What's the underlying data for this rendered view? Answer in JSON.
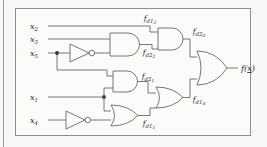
{
  "figure": {
    "kind": "logic-circuit-diagram",
    "colors": {
      "page_background": "#f7f7f5",
      "panel_background": "#fbfbf9",
      "frame_border": "#8d8d8d",
      "wire": "#555555",
      "label_text": "#2b2b2b",
      "junction_dot": "#333333"
    }
  },
  "inputs": [
    {
      "id": "x2",
      "base": "x",
      "sub": "2"
    },
    {
      "id": "x3",
      "base": "x",
      "sub": "3"
    },
    {
      "id": "x5",
      "base": "x",
      "sub": "5"
    },
    {
      "id": "x1",
      "base": "x",
      "sub": "1"
    },
    {
      "id": "x4",
      "base": "x",
      "sub": "4"
    }
  ],
  "signals": [
    {
      "id": "fd12",
      "base": "f",
      "sub": "d1",
      "subsub": "2"
    },
    {
      "id": "fd22",
      "base": "f",
      "sub": "d2",
      "subsub": "2"
    },
    {
      "id": "fd20",
      "base": "f",
      "sub": "d2",
      "subsub": "0"
    },
    {
      "id": "fd21",
      "base": "f",
      "sub": "d2",
      "subsub": "1"
    },
    {
      "id": "fd11",
      "base": "f",
      "sub": "d1",
      "subsub": "1"
    },
    {
      "id": "fd10",
      "base": "f",
      "sub": "d1",
      "subsub": "0"
    }
  ],
  "output": {
    "id": "fx",
    "prefix": "f(",
    "variable": "x",
    "suffix": ")",
    "variable_underlined": true
  },
  "gates": [
    {
      "id": "not-x5",
      "type": "NOT",
      "inputs": [
        "x5"
      ],
      "output": "notx5"
    },
    {
      "id": "and-upper",
      "type": "AND",
      "inputs": [
        "x3",
        "notx5"
      ],
      "output": "fd22"
    },
    {
      "id": "and-top",
      "type": "AND",
      "inputs": [
        "x2",
        "fd22"
      ],
      "output": "fd20"
    },
    {
      "id": "and-middle",
      "type": "AND",
      "inputs": [
        "notx5",
        "x1"
      ],
      "output": "fd21"
    },
    {
      "id": "not-x4",
      "type": "NOT",
      "inputs": [
        "x4"
      ],
      "output": "notx4"
    },
    {
      "id": "or-bottom",
      "type": "OR",
      "inputs": [
        "x1",
        "notx4"
      ],
      "output": "fd11"
    },
    {
      "id": "or-mid-right",
      "type": "OR",
      "inputs": [
        "fd21",
        "fd11"
      ],
      "output": "fd10"
    },
    {
      "id": "or-final",
      "type": "OR",
      "inputs": [
        "fd20",
        "fd10"
      ],
      "output": "fx"
    }
  ],
  "junctions": [
    {
      "id": "junction-x5",
      "on": "x5"
    },
    {
      "id": "junction-x1",
      "on": "x1"
    }
  ]
}
